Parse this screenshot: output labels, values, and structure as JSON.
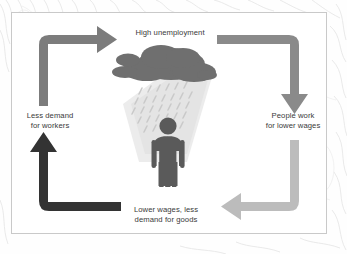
{
  "diagram": {
    "type": "cycle",
    "title_visible": false,
    "frame": {
      "border_color": "#c9c9c9",
      "background_color": "#ffffff"
    },
    "nodes": [
      {
        "id": "top",
        "label": "High unemployment",
        "position": "top"
      },
      {
        "id": "right",
        "label": "People work\nfor lower wages",
        "position": "right"
      },
      {
        "id": "bottom",
        "label": "Lower wages, less\ndemand for goods",
        "position": "bottom"
      },
      {
        "id": "left",
        "label": "Less demand\nfor workers",
        "position": "left"
      }
    ],
    "arrows": [
      {
        "id": "left-to-top",
        "from": "left",
        "to": "top",
        "direction": "up-then-right",
        "points": "right",
        "color": "#7c7c7c"
      },
      {
        "id": "top-to-right",
        "from": "top",
        "to": "right",
        "direction": "right-then-down",
        "points": "down",
        "color": "#8a8a8a"
      },
      {
        "id": "right-to-bottom",
        "from": "right",
        "to": "bottom",
        "direction": "down-then-left",
        "points": "left",
        "color": "#bcbcbc"
      },
      {
        "id": "bottom-to-left",
        "from": "bottom",
        "to": "left",
        "direction": "left-then-up",
        "points": "up",
        "color": "#333333"
      }
    ],
    "illustration": {
      "name": "rain-cloud-over-person",
      "cloud_color": "#6f6f6f",
      "rain_color": "#c4c4c4",
      "person_color": "#5a5a5a",
      "shadow_color": "#e3e3e3"
    },
    "text_color": "#3a3a3a"
  }
}
